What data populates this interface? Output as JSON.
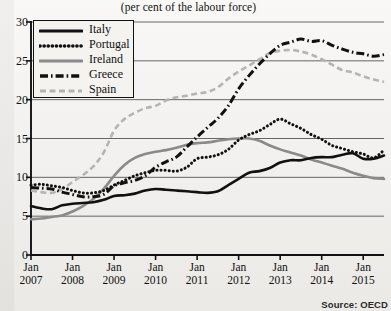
{
  "subtitle": "(per cent of the labour force)",
  "ghost_title": "",
  "source": "Source: OECD",
  "legend": {
    "items": [
      {
        "label": "Italy",
        "key": "italy",
        "color": "#111111",
        "style": "solid"
      },
      {
        "label": "Portugal",
        "key": "portugal",
        "color": "#111111",
        "style": "dotted"
      },
      {
        "label": "Ireland",
        "key": "ireland",
        "color": "#8a8a8a",
        "style": "solid"
      },
      {
        "label": "Greece",
        "key": "greece",
        "color": "#111111",
        "style": "dashdot"
      },
      {
        "label": "Spain",
        "key": "spain",
        "color": "#b4b4b4",
        "style": "dashed"
      }
    ]
  },
  "chart_data": {
    "type": "line",
    "title": "",
    "subtitle": "(per cent of the labour force)",
    "xlabel": "",
    "ylabel": "",
    "ylim": [
      0,
      30
    ],
    "yticks": [
      0,
      5,
      10,
      15,
      20,
      25,
      30
    ],
    "xlim": [
      "2007-01",
      "2015-07"
    ],
    "xticks": [
      "Jan 2007",
      "Jan 2008",
      "Jan 2009",
      "Jan 2010",
      "Jan 2011",
      "Jan 2012",
      "Jan 2013",
      "Jan 2014",
      "Jan 2015"
    ],
    "xtick_lines": [
      [
        "Jan",
        "2007"
      ],
      [
        "Jan",
        "2008"
      ],
      [
        "Jan",
        "2009"
      ],
      [
        "Jan",
        "2010"
      ],
      [
        "Jan",
        "2011"
      ],
      [
        "Jan",
        "2012"
      ],
      [
        "Jan",
        "2013"
      ],
      [
        "Jan",
        "2014"
      ],
      [
        "Jan",
        "2015"
      ]
    ],
    "grid": true,
    "legend_position": "upper left",
    "source": "Source: OECD",
    "x": [
      "2007-01",
      "2007-04",
      "2007-07",
      "2007-10",
      "2008-01",
      "2008-04",
      "2008-07",
      "2008-10",
      "2009-01",
      "2009-04",
      "2009-07",
      "2009-10",
      "2010-01",
      "2010-04",
      "2010-07",
      "2010-10",
      "2011-01",
      "2011-04",
      "2011-07",
      "2011-10",
      "2012-01",
      "2012-04",
      "2012-07",
      "2012-10",
      "2013-01",
      "2013-04",
      "2013-07",
      "2013-10",
      "2014-01",
      "2014-04",
      "2014-07",
      "2014-10",
      "2015-01",
      "2015-04",
      "2015-07"
    ],
    "series": [
      {
        "name": "Italy",
        "color": "#111111",
        "style": "solid",
        "values": [
          6.3,
          6.0,
          5.9,
          6.4,
          6.6,
          6.7,
          6.8,
          7.1,
          7.6,
          7.7,
          7.9,
          8.3,
          8.5,
          8.4,
          8.3,
          8.2,
          8.1,
          8.0,
          8.2,
          9.0,
          9.8,
          10.6,
          10.8,
          11.2,
          11.9,
          12.2,
          12.2,
          12.5,
          12.6,
          12.6,
          12.9,
          13.1,
          12.4,
          12.4,
          12.8
        ]
      },
      {
        "name": "Portugal",
        "color": "#111111",
        "style": "dotted",
        "values": [
          9.0,
          9.1,
          8.9,
          8.7,
          8.3,
          8.0,
          8.0,
          8.3,
          9.0,
          9.6,
          10.2,
          10.6,
          10.9,
          10.9,
          10.8,
          11.3,
          12.4,
          12.6,
          12.9,
          13.6,
          14.8,
          15.5,
          16.0,
          16.8,
          17.5,
          16.9,
          16.3,
          15.5,
          14.9,
          14.1,
          13.7,
          13.3,
          13.0,
          12.5,
          13.5
        ]
      },
      {
        "name": "Ireland",
        "color": "#8a8a8a",
        "style": "solid",
        "values": [
          4.6,
          4.7,
          4.9,
          5.1,
          5.6,
          6.3,
          7.2,
          8.5,
          10.2,
          11.6,
          12.5,
          13.0,
          13.3,
          13.5,
          13.8,
          14.2,
          14.4,
          14.5,
          14.7,
          14.9,
          15.0,
          15.0,
          14.7,
          14.1,
          13.6,
          13.2,
          12.8,
          12.3,
          11.9,
          11.5,
          11.1,
          10.6,
          10.2,
          9.9,
          9.8
        ]
      },
      {
        "name": "Greece",
        "color": "#111111",
        "style": "dashdot",
        "values": [
          8.7,
          8.6,
          8.5,
          8.1,
          7.8,
          7.5,
          7.5,
          7.8,
          8.9,
          9.3,
          9.6,
          10.2,
          11.3,
          12.0,
          12.6,
          13.9,
          15.2,
          16.4,
          17.6,
          19.2,
          21.4,
          23.1,
          24.6,
          25.9,
          27.0,
          27.4,
          27.8,
          27.5,
          27.6,
          27.0,
          26.5,
          26.1,
          25.9,
          25.6,
          25.8
        ]
      },
      {
        "name": "Spain",
        "color": "#b4b4b4",
        "style": "dashed",
        "values": [
          8.3,
          8.1,
          8.0,
          8.5,
          9.4,
          10.3,
          11.4,
          13.2,
          16.0,
          17.5,
          18.3,
          18.9,
          19.2,
          19.9,
          20.3,
          20.5,
          20.8,
          21.0,
          21.6,
          22.7,
          23.6,
          24.4,
          25.2,
          26.0,
          26.3,
          26.4,
          26.2,
          25.8,
          25.2,
          24.5,
          23.8,
          23.5,
          23.0,
          22.6,
          22.3
        ]
      }
    ]
  }
}
